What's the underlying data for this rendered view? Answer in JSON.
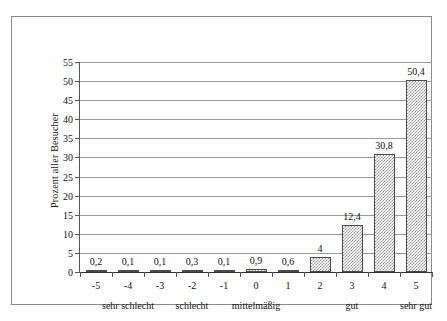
{
  "chart_data": {
    "type": "bar",
    "title": "",
    "subtitle": "",
    "xlabel": "",
    "ylabel": "Prozent aller Besucher",
    "categories": [
      "-5",
      "-4",
      "-3",
      "-2",
      "-1",
      "0",
      "1",
      "2",
      "3",
      "4",
      "5"
    ],
    "values": [
      0.2,
      0.1,
      0.1,
      0.3,
      0.1,
      0.9,
      0.6,
      4,
      12.4,
      30.8,
      50.4
    ],
    "value_labels": [
      "0,2",
      "0,1",
      "0,1",
      "0,3",
      "0,1",
      "0,9",
      "0,6",
      "4",
      "12,4",
      "30,8",
      "50,4"
    ],
    "ylim": [
      0,
      55
    ],
    "ytick_step": 5,
    "yticks": [
      0,
      5,
      10,
      15,
      20,
      25,
      30,
      35,
      40,
      45,
      50,
      55
    ],
    "ytick_labels": [
      "0",
      "5",
      "10",
      "15",
      "20",
      "25",
      "30",
      "35",
      "40",
      "45",
      "50",
      "55"
    ],
    "grid": "horizontal",
    "legend": "none",
    "group_labels": [
      {
        "text": "sehr schlecht",
        "center_category": "-4"
      },
      {
        "text": "schlecht",
        "center_category": "-2"
      },
      {
        "text": "mittelmäßig",
        "center_category": "0"
      },
      {
        "text": "gut",
        "center_category": "3"
      },
      {
        "text": "sehr gut",
        "center_category": "5"
      }
    ],
    "colors": {
      "bar_fill": "#9a9a9a",
      "bar_background": "#ffffff",
      "bar_border": "#4a4a4a",
      "gridline": "#9a9a9a",
      "axis": "#333333",
      "frame": "#8c8c8c",
      "text": "#111111",
      "page_background": "#ffffff"
    }
  }
}
